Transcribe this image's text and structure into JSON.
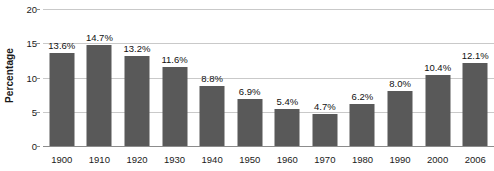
{
  "chart_data": {
    "type": "bar",
    "title": "",
    "xlabel": "",
    "ylabel": "Percentage",
    "categories": [
      "1900",
      "1910",
      "1920",
      "1930",
      "1940",
      "1950",
      "1960",
      "1970",
      "1980",
      "1990",
      "2000",
      "2006"
    ],
    "values": [
      13.6,
      14.7,
      13.2,
      11.6,
      8.8,
      6.9,
      5.4,
      4.7,
      6.2,
      8.0,
      10.4,
      12.1
    ],
    "data_labels": [
      "13.6%",
      "14.7%",
      "13.2%",
      "11.6%",
      "8.8%",
      "6.9%",
      "5.4%",
      "4.7%",
      "6.2%",
      "8.0%",
      "10.4%",
      "12.1%"
    ],
    "ylim": [
      0,
      20
    ],
    "yticks": [
      0,
      5,
      10,
      15,
      20
    ],
    "ytick_labels": [
      "0",
      "5",
      "10",
      "15",
      "20"
    ],
    "grid": true,
    "legend": false,
    "bar_color": "#595959",
    "gridline_color": "#c9c9c9",
    "axis_color": "#8c8c8c"
  }
}
